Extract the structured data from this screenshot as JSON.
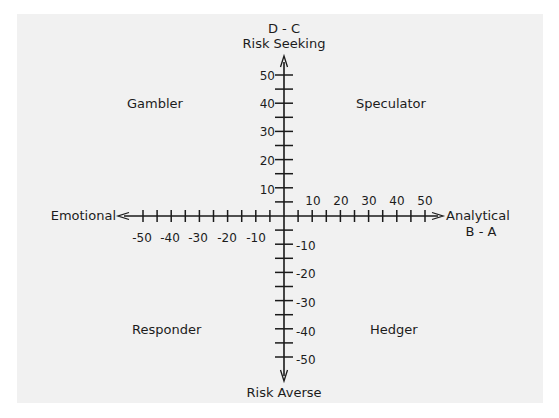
{
  "chart_data": {
    "type": "quadrant",
    "title": "",
    "x_axis": {
      "label_top": "",
      "negative_label": "Emotional",
      "positive_label": "Analytical",
      "positive_sublabel": "B - A",
      "range": [
        -50,
        50
      ],
      "ticks": [
        -50,
        -45,
        -40,
        -35,
        -30,
        -25,
        -20,
        -15,
        -10,
        -5,
        5,
        10,
        15,
        20,
        25,
        30,
        35,
        40,
        45,
        50
      ],
      "tick_labels": [
        "-50",
        "-40",
        "-30",
        "-20",
        "-10",
        "10",
        "20",
        "30",
        "40",
        "50"
      ]
    },
    "y_axis": {
      "formula_label": "D - C",
      "positive_label": "Risk Seeking",
      "negative_label": "Risk Averse",
      "range": [
        -50,
        50
      ],
      "ticks": [
        -50,
        -45,
        -40,
        -35,
        -30,
        -25,
        -20,
        -15,
        -10,
        -5,
        5,
        10,
        15,
        20,
        25,
        30,
        35,
        40,
        45,
        50
      ],
      "tick_labels": [
        "50",
        "40",
        "30",
        "20",
        "10",
        "-10",
        "-20",
        "-30",
        "-40",
        "-50"
      ]
    },
    "quadrants": {
      "top_left": "Gambler",
      "top_right": "Speculator",
      "bottom_left": "Responder",
      "bottom_right": "Hedger"
    },
    "grid": false,
    "legend": "none"
  },
  "labels": {
    "y_formula": "D - C",
    "y_top": "Risk Seeking",
    "y_bottom": "Risk Averse",
    "x_left": "Emotional",
    "x_right": "Analytical",
    "x_formula": "B - A",
    "q_tl": "Gambler",
    "q_tr": "Speculator",
    "q_bl": "Responder",
    "q_br": "Hedger",
    "xt": [
      "-50",
      "-40",
      "-30",
      "-20",
      "-10",
      "10",
      "20",
      "30",
      "40",
      "50"
    ],
    "yt": [
      "50",
      "40",
      "30",
      "20",
      "10",
      "-10",
      "-20",
      "-30",
      "-40",
      "-50"
    ]
  },
  "colors": {
    "panel": "#f1f1f1",
    "ink": "#1a1a1a"
  }
}
